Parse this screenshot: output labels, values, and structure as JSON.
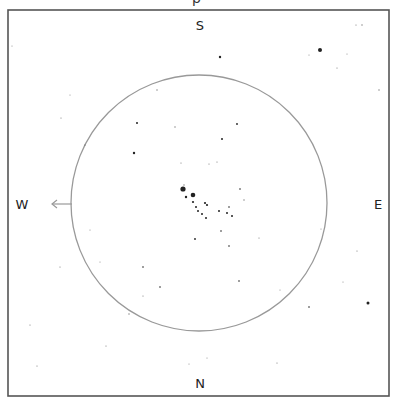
{
  "title_fragment": "p",
  "colors": {
    "frame": "#555555",
    "circle": "#999999",
    "star": "#222222",
    "arrow": "#999999",
    "label": "#222222",
    "background": "#ffffff"
  },
  "frame": {
    "x": 8,
    "y": 10,
    "width": 381,
    "height": 386
  },
  "field_circle": {
    "cx": 199,
    "cy": 203,
    "r": 128
  },
  "labels": {
    "top": {
      "text": "S",
      "x": 200,
      "y": 30
    },
    "bottom": {
      "text": "N",
      "x": 200,
      "y": 388
    },
    "left": {
      "text": "W",
      "x": 22,
      "y": 209
    },
    "right": {
      "text": "E",
      "x": 378,
      "y": 209
    }
  },
  "arrow": {
    "x1": 72,
    "y1": 204,
    "x2": 52,
    "y2": 204,
    "direction": "west"
  },
  "stars": [
    {
      "x": 183,
      "y": 189,
      "r": 2.6
    },
    {
      "x": 193,
      "y": 195,
      "r": 2.3
    },
    {
      "x": 186,
      "y": 197,
      "r": 1.2
    },
    {
      "x": 193,
      "y": 202,
      "r": 1.1
    },
    {
      "x": 205,
      "y": 203,
      "r": 1.1
    },
    {
      "x": 207,
      "y": 205,
      "r": 1.1
    },
    {
      "x": 196,
      "y": 207,
      "r": 1.0
    },
    {
      "x": 198,
      "y": 211,
      "r": 1.0
    },
    {
      "x": 202,
      "y": 214,
      "r": 1.0
    },
    {
      "x": 206,
      "y": 218,
      "r": 1.0
    },
    {
      "x": 219,
      "y": 211,
      "r": 1.0
    },
    {
      "x": 227,
      "y": 213,
      "r": 1.0
    },
    {
      "x": 232,
      "y": 216,
      "r": 1.0
    },
    {
      "x": 229,
      "y": 207,
      "r": 0.8
    },
    {
      "x": 240,
      "y": 189,
      "r": 0.8
    },
    {
      "x": 244,
      "y": 200,
      "r": 0.7
    },
    {
      "x": 184,
      "y": 185,
      "r": 0.7
    },
    {
      "x": 320,
      "y": 50,
      "r": 2.0
    },
    {
      "x": 368,
      "y": 303,
      "r": 1.5
    },
    {
      "x": 220,
      "y": 57,
      "r": 1.2
    },
    {
      "x": 137,
      "y": 123,
      "r": 1.0
    },
    {
      "x": 222,
      "y": 139,
      "r": 1.0
    },
    {
      "x": 237,
      "y": 124,
      "r": 0.9
    },
    {
      "x": 134,
      "y": 153,
      "r": 1.2
    },
    {
      "x": 157,
      "y": 90,
      "r": 0.7
    },
    {
      "x": 175,
      "y": 127,
      "r": 0.7
    },
    {
      "x": 181,
      "y": 163,
      "r": 0.6
    },
    {
      "x": 209,
      "y": 164,
      "r": 0.6
    },
    {
      "x": 217,
      "y": 162,
      "r": 0.6
    },
    {
      "x": 195,
      "y": 239,
      "r": 0.9
    },
    {
      "x": 221,
      "y": 231,
      "r": 0.8
    },
    {
      "x": 229,
      "y": 246,
      "r": 0.8
    },
    {
      "x": 239,
      "y": 281,
      "r": 0.8
    },
    {
      "x": 309,
      "y": 307,
      "r": 0.8
    },
    {
      "x": 277,
      "y": 363,
      "r": 0.6
    },
    {
      "x": 143,
      "y": 267,
      "r": 0.8
    },
    {
      "x": 160,
      "y": 287,
      "r": 0.8
    },
    {
      "x": 143,
      "y": 296,
      "r": 0.6
    },
    {
      "x": 129,
      "y": 314,
      "r": 0.7
    },
    {
      "x": 85,
      "y": 145,
      "r": 0.6
    },
    {
      "x": 30,
      "y": 325,
      "r": 0.6
    },
    {
      "x": 37,
      "y": 366,
      "r": 0.6
    },
    {
      "x": 60,
      "y": 267,
      "r": 0.6
    },
    {
      "x": 61,
      "y": 118,
      "r": 0.6
    },
    {
      "x": 106,
      "y": 346,
      "r": 0.6
    },
    {
      "x": 356,
      "y": 25,
      "r": 0.6
    },
    {
      "x": 362,
      "y": 25,
      "r": 0.7
    },
    {
      "x": 379,
      "y": 90,
      "r": 0.7
    },
    {
      "x": 337,
      "y": 68,
      "r": 0.6
    },
    {
      "x": 259,
      "y": 238,
      "r": 0.6
    },
    {
      "x": 357,
      "y": 251,
      "r": 0.6
    },
    {
      "x": 343,
      "y": 282,
      "r": 0.5
    },
    {
      "x": 12,
      "y": 46,
      "r": 0.5
    },
    {
      "x": 309,
      "y": 55,
      "r": 0.5
    },
    {
      "x": 347,
      "y": 54,
      "r": 0.5
    },
    {
      "x": 189,
      "y": 364,
      "r": 0.5
    },
    {
      "x": 207,
      "y": 358,
      "r": 0.5
    },
    {
      "x": 70,
      "y": 95,
      "r": 0.5
    },
    {
      "x": 90,
      "y": 230,
      "r": 0.5
    },
    {
      "x": 100,
      "y": 262,
      "r": 0.5
    },
    {
      "x": 280,
      "y": 290,
      "r": 0.5
    },
    {
      "x": 321,
      "y": 229,
      "r": 0.5
    }
  ]
}
